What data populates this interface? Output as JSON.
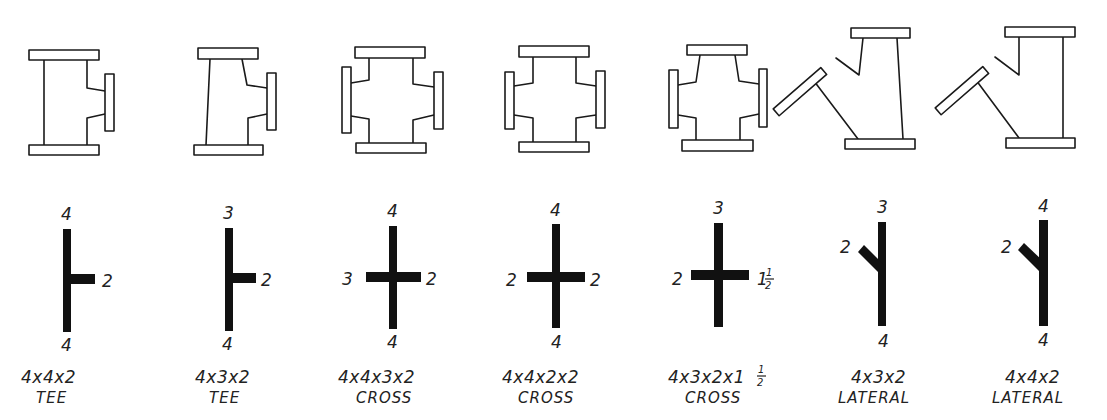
{
  "colors": {
    "ink": "#111111",
    "paper": "#ffffff"
  },
  "fittings": [
    {
      "id": "tee-4x4x2",
      "size": "4x4x2",
      "type": "TEE",
      "ends": {
        "top": "4",
        "bottom": "4",
        "right": "2"
      }
    },
    {
      "id": "tee-4x3x2",
      "size": "4x3x2",
      "type": "TEE",
      "ends": {
        "top": "3",
        "bottom": "4",
        "right": "2"
      }
    },
    {
      "id": "cross-4x4x3x2",
      "size": "4x4x3x2",
      "type": "CROSS",
      "ends": {
        "top": "4",
        "bottom": "4",
        "left": "3",
        "right": "2"
      }
    },
    {
      "id": "cross-4x4x2x2",
      "size": "4x4x2x2",
      "type": "CROSS",
      "ends": {
        "top": "4",
        "bottom": "4",
        "left": "2",
        "right": "2"
      }
    },
    {
      "id": "cross-4x3x2x1half",
      "size": "4x3x2x1",
      "size_fraction": "1/2",
      "type": "CROSS",
      "ends": {
        "top": "3",
        "bottom": "4",
        "left": "2",
        "right": "1",
        "right_fraction": "1/2"
      }
    },
    {
      "id": "lateral-4x3x2",
      "size": "4x3x2",
      "type": "LATERAL",
      "ends": {
        "top": "3",
        "bottom": "4",
        "branch": "2"
      }
    },
    {
      "id": "lateral-4x4x2",
      "size": "4x4x2",
      "type": "LATERAL",
      "ends": {
        "top": "4",
        "bottom": "4",
        "branch": "2"
      }
    }
  ]
}
